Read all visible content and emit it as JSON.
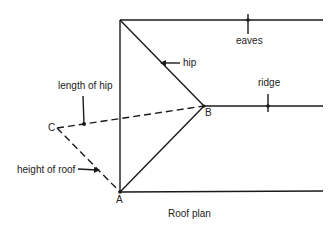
{
  "diagram": {
    "title": "Roof plan",
    "labels": {
      "eaves": "eaves",
      "hip": "hip",
      "ridge": "ridge",
      "length_of_hip": "length of hip",
      "height_of_roof": "height of roof"
    },
    "points": {
      "A": "A",
      "B": "B",
      "C": "C"
    }
  }
}
